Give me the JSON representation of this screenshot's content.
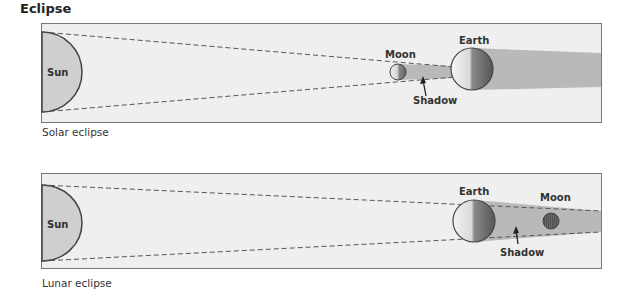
{
  "title": "Eclipse",
  "colors": {
    "frame_bg": "#efefef",
    "frame_border": "#777777",
    "sun_fill": "#cfcfcf",
    "shadow_fill": "#b9b9b9",
    "body_outline": "#444444"
  },
  "panels": [
    {
      "id": "solar",
      "caption": "Solar eclipse",
      "labels": {
        "sun": "Sun",
        "moon": "Moon",
        "earth": "Earth",
        "shadow": "Shadow"
      }
    },
    {
      "id": "lunar",
      "caption": "Lunar eclipse",
      "labels": {
        "sun": "Sun",
        "earth": "Earth",
        "moon": "Moon",
        "shadow": "Shadow"
      }
    }
  ]
}
